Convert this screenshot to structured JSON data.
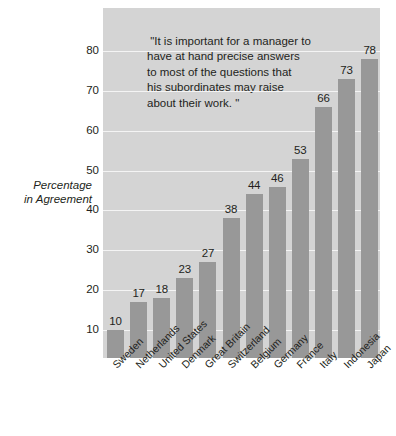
{
  "chart_data": {
    "type": "bar",
    "title": "",
    "subtitle": "",
    "xlabel": "",
    "ylabel": "Percentage in Agreement",
    "ylim": [
      0,
      85
    ],
    "yticks": [
      10,
      20,
      30,
      40,
      50,
      60,
      70,
      80
    ],
    "grid": true,
    "legend": false,
    "orientation": "vertical",
    "categories": [
      "Sweden",
      "Netherlands",
      "United States",
      "Denmark",
      "Great Britain",
      "Switzerland",
      "Belgium",
      "Germany",
      "France",
      "Italy",
      "Indonesia",
      "Japan"
    ],
    "values": [
      10,
      17,
      18,
      23,
      27,
      38,
      44,
      46,
      53,
      66,
      73,
      78
    ],
    "value_labels": [
      "10",
      "17",
      "18",
      "23",
      "27",
      "38",
      "44",
      "46",
      "53",
      "66",
      "73",
      "78"
    ],
    "annotations": [
      {
        "name": "quote-annotation",
        "lines": [
          " \"It is important for a manager to",
          "have at hand precise answers",
          "to most of the questions that",
          "his subordinates may raise",
          "about their work. \""
        ]
      }
    ],
    "colors": {
      "bar": "#989898",
      "plot_background": "#d4d4d4",
      "gridline": "#f4f4f4",
      "figure_background": "#ffffff",
      "text": "#231f20"
    }
  },
  "axis": {
    "y_title_lines": [
      "Percentage",
      "in Agreement"
    ],
    "y_tick_labels": [
      "80",
      "70",
      "60",
      "50",
      "40",
      "30",
      "20",
      "10"
    ]
  }
}
